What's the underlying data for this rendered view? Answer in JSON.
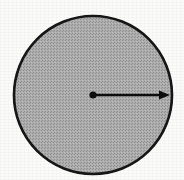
{
  "figure": {
    "background_color": "#fbfbfa",
    "ink_color": "#1a1a1a",
    "fill_color": "#a9a9a9",
    "fill_style": "halftone-gray",
    "canvas": {
      "width": 184,
      "height": 180
    },
    "circle": {
      "label": "circle",
      "center_x": 93,
      "center_y": 95,
      "radius": 79,
      "stroke_width": 2.6,
      "stroke_color": "#131313",
      "fill_color": "#a9a9a9"
    },
    "center_dot": {
      "label": "center point",
      "cx": 93,
      "cy": 95,
      "r": 3.6,
      "color": "#111111"
    },
    "radius_arrow": {
      "label": "radius",
      "from_x": 93,
      "from_y": 95,
      "to_x": 170,
      "to_y": 95,
      "stroke_width": 2.6,
      "color": "#111111",
      "arrowhead": {
        "name": "solid-triangle",
        "length": 11,
        "half_width": 4.5
      }
    }
  }
}
